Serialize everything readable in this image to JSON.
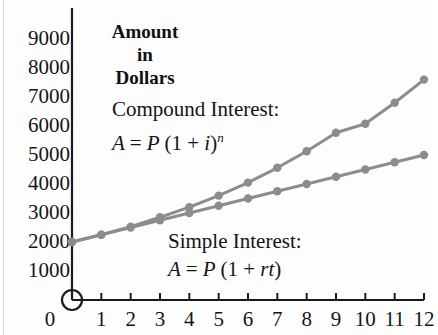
{
  "figure": {
    "axis_title_line1": "Amount",
    "axis_title_line2": "in",
    "axis_title_line3": "Dollars",
    "compound_label": "Compound Interest:",
    "compound_formula_prefix": "A",
    "compound_formula_eq": "=",
    "compound_formula_p": "P",
    "compound_formula_paren_open": "(1",
    "compound_formula_plus": "+",
    "compound_formula_i": "i",
    "compound_formula_close": ")",
    "compound_formula_exp": "n",
    "simple_label": "Simple Interest:",
    "simple_formula_prefix": "A",
    "simple_formula_eq": "=",
    "simple_formula_p": "P",
    "simple_formula_paren_open": "(1",
    "simple_formula_plus": "+",
    "simple_formula_rt": "rt",
    "simple_formula_close": ")",
    "origin_marker": "origin-open-circle",
    "line_color": "#8c8c8c",
    "marker_color": "#8c8c8c",
    "axis_color": "#1a1a1a"
  },
  "chart_data": {
    "type": "line",
    "title": "Amount in Dollars",
    "xlabel": "",
    "ylabel": "Amount in Dollars",
    "x": [
      0,
      1,
      2,
      3,
      4,
      5,
      6,
      7,
      8,
      9,
      10,
      11,
      12
    ],
    "xlim": [
      0,
      12
    ],
    "ylim": [
      0,
      9000
    ],
    "xticks": [
      0,
      1,
      2,
      3,
      4,
      5,
      6,
      7,
      8,
      9,
      10,
      11,
      12
    ],
    "xtick_labels": [
      "0",
      "1",
      "2",
      "3",
      "4",
      "5",
      "6",
      "7",
      "8",
      "9",
      "10",
      "11",
      "12"
    ],
    "yticks": [
      1000,
      2000,
      3000,
      4000,
      5000,
      6000,
      7000,
      8000,
      9000
    ],
    "ytick_labels": [
      "1000",
      "2000",
      "3000",
      "4000",
      "5000",
      "6000",
      "7000",
      "8000",
      "9000"
    ],
    "grid": false,
    "legend": "none",
    "series": [
      {
        "name": "Compound Interest",
        "formula": "A = P (1 + i)^n",
        "values": [
          2000,
          2250,
          2530,
          2850,
          3200,
          3600,
          4050,
          4560,
          5130,
          5770,
          6080,
          6800,
          7600
        ]
      },
      {
        "name": "Simple Interest",
        "formula": "A = P (1 + rt)",
        "values": [
          2000,
          2250,
          2500,
          2750,
          3000,
          3250,
          3500,
          3750,
          4000,
          4250,
          4500,
          4750,
          5000
        ]
      }
    ],
    "annotations": [
      {
        "text": "Compound Interest:",
        "x": 2.0,
        "y": 6300
      },
      {
        "text": "A = P (1 + i)^n",
        "x": 2.0,
        "y": 5600
      },
      {
        "text": "Simple Interest:",
        "x": 4.4,
        "y": 1900
      },
      {
        "text": "A = P (1 + rt)",
        "x": 4.4,
        "y": 1200
      }
    ]
  }
}
